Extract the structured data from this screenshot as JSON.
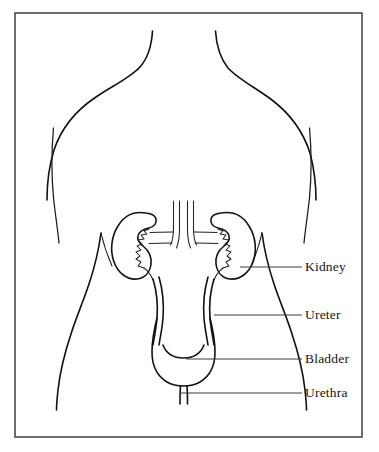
{
  "figure": {
    "kind": "anatomical-line-drawing",
    "background_color": "#ffffff",
    "ink_color": "#111111",
    "frame_color": "#4a4a4a",
    "width": 379,
    "height": 452
  },
  "frame": {
    "x": 15,
    "y": 13,
    "width": 347,
    "height": 424
  },
  "labels": [
    {
      "id": "kidney",
      "text": "Kidney",
      "leader_from_x": 240,
      "leader_to_x": 302,
      "leader_y": 267
    },
    {
      "id": "ureter",
      "text": "Ureter",
      "leader_from_x": 214,
      "leader_to_x": 302,
      "leader_y": 315
    },
    {
      "id": "bladder",
      "text": "Bladder",
      "leader_from_x": 186,
      "leader_to_x": 302,
      "leader_y": 359
    },
    {
      "id": "urethra",
      "text": "Urethra",
      "leader_from_x": 180,
      "leader_to_x": 302,
      "leader_y": 393
    }
  ],
  "organs": [
    {
      "id": "kidney-left",
      "name": "Kidney (left)"
    },
    {
      "id": "kidney-right",
      "name": "Kidney (right)"
    },
    {
      "id": "ureter-left",
      "name": "Ureter (left)"
    },
    {
      "id": "ureter-right",
      "name": "Ureter (right)"
    },
    {
      "id": "bladder",
      "name": "Urinary bladder"
    },
    {
      "id": "urethra",
      "name": "Urethra"
    },
    {
      "id": "great-vessels",
      "name": "Aorta and inferior vena cava"
    }
  ],
  "body_outline": [
    {
      "id": "neck-left",
      "name": "Left neck and shoulder"
    },
    {
      "id": "neck-right",
      "name": "Right neck and shoulder"
    },
    {
      "id": "arm-left",
      "name": "Left arm inner line"
    },
    {
      "id": "arm-right",
      "name": "Right arm inner line"
    },
    {
      "id": "torso-left",
      "name": "Left torso flank"
    },
    {
      "id": "torso-right",
      "name": "Right torso flank"
    }
  ]
}
